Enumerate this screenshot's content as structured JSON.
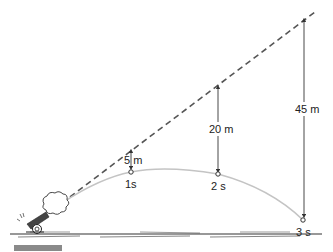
{
  "diagram": {
    "colors": {
      "dashed_line": "#555555",
      "trajectory": "#bdbdbd",
      "arrows": "#333333",
      "ground": "#333333",
      "bar": "#8a8a8a"
    },
    "points": [
      {
        "time_label": "1s",
        "drop_label": "5 m"
      },
      {
        "time_label": "2 s",
        "drop_label": "20 m"
      },
      {
        "time_label": "3 s",
        "drop_label": "45 m"
      }
    ],
    "elements": {
      "cannon": "cannon-icon",
      "smoke": "smoke-puff-icon",
      "straight_path": "dashed-line",
      "trajectory": "parabolic-curve",
      "ground": "ground-line"
    }
  }
}
